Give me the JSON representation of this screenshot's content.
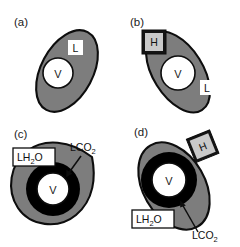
{
  "figure": {
    "background_color": "#ffffff",
    "cytoplasm_color": "#7d7d7d",
    "outline_color": "#0d0d0d",
    "vacuole_color": "#ffffff",
    "ring_color": "#000000",
    "hbox_fill": "#c9c9c9",
    "hbox_border": "#141414"
  },
  "panels": [
    {
      "id": "a",
      "label": "(a)",
      "shape": "ellipse",
      "vacuole_label": "V",
      "labels": [
        {
          "name": "lipid-low",
          "text": "L",
          "style": "plain-white-box"
        }
      ],
      "has_ring": false,
      "callouts": []
    },
    {
      "id": "b",
      "label": "(b)",
      "shape": "ellipse",
      "vacuole_label": "V",
      "labels": [
        {
          "name": "hydration-high",
          "text": "H",
          "style": "bordered-gray-box"
        },
        {
          "name": "lipid-low",
          "text": "L",
          "style": "plain-white-box"
        }
      ],
      "has_ring": false,
      "callouts": []
    },
    {
      "id": "c",
      "label": "(c)",
      "shape": "teardrop",
      "vacuole_label": "V",
      "labels": [
        {
          "name": "lipid-water",
          "text": "LH2O",
          "text_main": "LH",
          "text_sub": "2",
          "text_tail": "O",
          "style": "bordered-white-box"
        }
      ],
      "has_ring": true,
      "callouts": [
        {
          "name": "lipid-co2",
          "text": "LCO2",
          "text_main": "LCO",
          "text_sub": "2",
          "target": "black-ring"
        }
      ]
    },
    {
      "id": "d",
      "label": "(d)",
      "shape": "ellipse",
      "vacuole_label": "V",
      "labels": [
        {
          "name": "hydration-high",
          "text": "H",
          "style": "bordered-gray-box-rotated"
        },
        {
          "name": "lipid-water",
          "text": "LH2O",
          "text_main": "LH",
          "text_sub": "2",
          "text_tail": "O",
          "style": "bordered-white-box"
        }
      ],
      "has_ring": true,
      "callouts": [
        {
          "name": "lipid-co2",
          "text": "LCO2",
          "text_main": "LCO",
          "text_sub": "2",
          "target": "black-ring"
        }
      ]
    }
  ]
}
